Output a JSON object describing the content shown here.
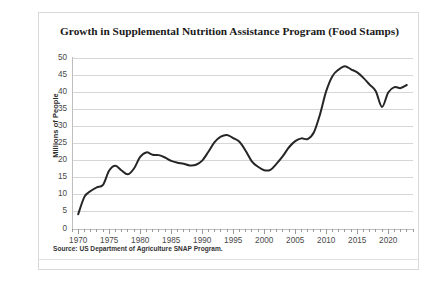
{
  "chart_card": {
    "title": "Growth in Supplemental Nutrition Assistance Program (Food Stamps)",
    "source_note": "Source: US Department of Agriculture SNAP Program."
  },
  "chart_data": {
    "type": "line",
    "title": "Growth in Supplemental Nutrition Assistance Program (Food Stamps)",
    "xlabel": "",
    "ylabel": "Millions of People",
    "xlim": [
      1969,
      2024
    ],
    "ylim": [
      0,
      50
    ],
    "grid": true,
    "legend": false,
    "line_color": "#262626",
    "y_ticks": [
      0,
      5,
      10,
      15,
      20,
      25,
      30,
      35,
      40,
      45,
      50
    ],
    "x_ticks": [
      1970,
      1975,
      1980,
      1985,
      1990,
      1995,
      2000,
      2005,
      2010,
      2015,
      2020
    ],
    "x_minor_tick_step": 1,
    "series": [
      {
        "name": "SNAP Participation",
        "x": [
          1970,
          1971,
          1972,
          1973,
          1974,
          1975,
          1976,
          1977,
          1978,
          1979,
          1980,
          1981,
          1982,
          1983,
          1984,
          1985,
          1986,
          1987,
          1988,
          1989,
          1990,
          1991,
          1992,
          1993,
          1994,
          1995,
          1996,
          1997,
          1998,
          1999,
          2000,
          2001,
          2002,
          2003,
          2004,
          2005,
          2006,
          2007,
          2008,
          2009,
          2010,
          2011,
          2012,
          2013,
          2014,
          2015,
          2016,
          2017,
          2018,
          2019,
          2020,
          2021,
          2022,
          2023
        ],
        "values": [
          4.3,
          9.4,
          11.1,
          12.2,
          12.9,
          17.1,
          18.5,
          17.1,
          16.0,
          17.7,
          21.1,
          22.4,
          21.7,
          21.6,
          20.9,
          19.9,
          19.4,
          19.1,
          18.6,
          18.8,
          20.0,
          22.6,
          25.4,
          27.0,
          27.5,
          26.6,
          25.5,
          22.9,
          19.8,
          18.2,
          17.2,
          17.3,
          19.1,
          21.3,
          23.9,
          25.7,
          26.5,
          26.3,
          28.2,
          33.5,
          40.3,
          44.7,
          46.6,
          47.6,
          46.7,
          45.8,
          44.2,
          42.2,
          40.3,
          35.7,
          39.9,
          41.5,
          41.2,
          42.1
        ]
      }
    ]
  }
}
